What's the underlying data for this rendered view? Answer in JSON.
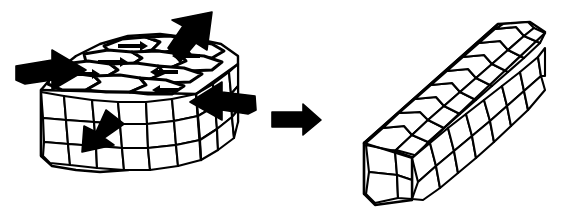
{
  "figure": {
    "title": "Grain structure deformation during mechanical working",
    "background_color": "#ffffff",
    "line_color": "#000000",
    "fill_color": "#ffffff",
    "style": "black-and-white line drawing",
    "caption": ""
  },
  "left_block": {
    "name": "undeformed-block",
    "description": "Cube of metal with equiaxed polygonal grains, shown in isometric view",
    "grain_shape": "equiaxed",
    "faces": [
      "top",
      "front",
      "right"
    ]
  },
  "right_block": {
    "name": "deformed-bar",
    "description": "Elongated bar with flattened, stretched grains after working",
    "grain_shape": "elongated",
    "faces": [
      "top",
      "front",
      "right",
      "near-end"
    ]
  },
  "transform_arrow": {
    "name": "transform-arrow",
    "direction": "right",
    "label": ""
  },
  "load_arrows": [
    {
      "name": "load-arrow-left",
      "direction": "right",
      "position": "left-face"
    },
    {
      "name": "load-arrow-top",
      "direction": "up-right",
      "position": "top-rear"
    },
    {
      "name": "load-arrow-right",
      "direction": "left",
      "position": "right-face"
    },
    {
      "name": "load-arrow-front",
      "direction": "down-left",
      "position": "front-face"
    }
  ],
  "flow_arrows": [
    {
      "name": "flow-arrow-1",
      "direction": "right"
    },
    {
      "name": "flow-arrow-2",
      "direction": "right"
    },
    {
      "name": "flow-arrow-3",
      "direction": "right"
    },
    {
      "name": "flow-arrow-4",
      "direction": "left"
    },
    {
      "name": "flow-arrow-5",
      "direction": "left"
    },
    {
      "name": "flow-arrow-6",
      "direction": "left"
    }
  ]
}
